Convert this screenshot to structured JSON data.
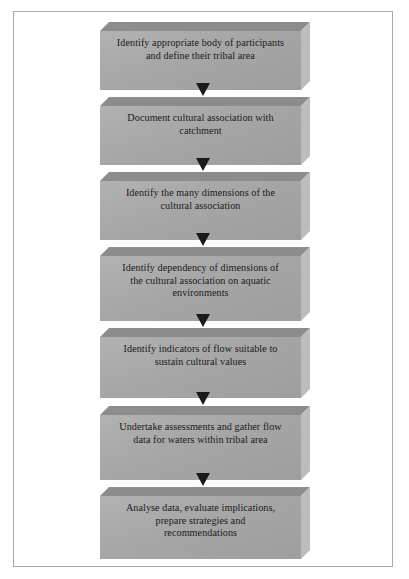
{
  "figure": {
    "type": "flowchart",
    "orientation": "vertical-top-to-bottom",
    "node_shape": "3d-extruded-rectangle",
    "connector": "downward-filled-triangle-arrow",
    "colors": {
      "page_background": "#ffffff",
      "page_border": "#a9a9a9",
      "block_front_face": "#a6a6a6",
      "block_top_face": "#8a8a8a",
      "block_side_face": "#b0b0b0",
      "text": "#1b1b1b",
      "arrow": "#1a1a1a"
    },
    "steps": [
      {
        "index": 1,
        "text": "Identify appropriate body of participants\nand define their tribal area",
        "lines": 2
      },
      {
        "index": 2,
        "text": "Document cultural association with\ncatchment",
        "lines": 2
      },
      {
        "index": 3,
        "text": "Identify the many dimensions of the\ncultural association",
        "lines": 2
      },
      {
        "index": 4,
        "text": "Identify dependency of dimensions of\nthe cultural association on aquatic\nenvironments",
        "lines": 3
      },
      {
        "index": 5,
        "text": "Identify indicators of flow suitable to\nsustain cultural values",
        "lines": 2
      },
      {
        "index": 6,
        "text": "Undertake assessments and gather flow\ndata for waters within tribal area",
        "lines": 2
      },
      {
        "index": 7,
        "text": "Analyse data, evaluate implications,\nprepare strategies and\nrecommendations",
        "lines": 3
      }
    ],
    "arrow_count": 6
  }
}
